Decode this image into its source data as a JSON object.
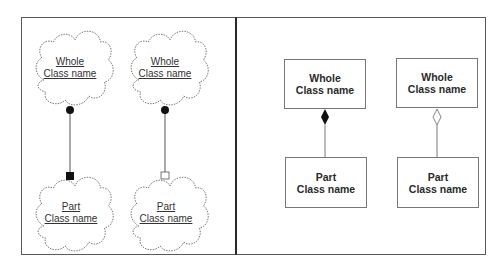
{
  "left_panel": {
    "notation": "cloud",
    "diagrams": [
      {
        "whole": {
          "line1": "Whole",
          "line2": "Class name"
        },
        "part": {
          "line1": "Part",
          "line2": "Class name"
        },
        "whole_end": "filled-dot",
        "part_end": "filled-square"
      },
      {
        "whole": {
          "line1": "Whole",
          "line2": "Class name"
        },
        "part": {
          "line1": "Part",
          "line2": "Class name"
        },
        "whole_end": "filled-dot",
        "part_end": "hollow-square"
      }
    ]
  },
  "right_panel": {
    "notation": "uml-box",
    "diagrams": [
      {
        "whole": {
          "line1": "Whole",
          "line2": "Class name"
        },
        "part": {
          "line1": "Part",
          "line2": "Class name"
        },
        "whole_end": "filled-diamond"
      },
      {
        "whole": {
          "line1": "Whole",
          "line2": "Class name"
        },
        "part": {
          "line1": "Part",
          "line2": "Class name"
        },
        "whole_end": "hollow-diamond"
      }
    ]
  },
  "colors": {
    "line": "#555555",
    "fill_dark": "#111111",
    "frame": "#5a5a5a"
  }
}
